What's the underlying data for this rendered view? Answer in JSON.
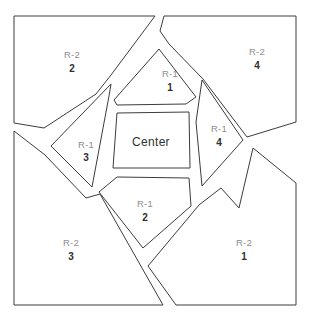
{
  "map": {
    "title": "Zoning Parcel Map",
    "canvas": {
      "width": 314,
      "height": 321
    },
    "style": {
      "background_color": "#ffffff",
      "parcel_fill": "#ffffff",
      "parcel_stroke": "#3c3c3c",
      "zone_label_color": "#8e8e8e",
      "number_label_color": "#2f2f2f",
      "center_label_color": "#2f2f2f"
    },
    "parcels": [
      {
        "id": "r2-2",
        "zone": "R-2",
        "number": "2",
        "label_x": 72,
        "label_y": 55,
        "number_x": 72,
        "number_y": 69,
        "points": "14,16 155,16 111,75 96,94 44,128 14,123"
      },
      {
        "id": "r2-4",
        "zone": "R-2",
        "number": "4",
        "label_x": 257,
        "label_y": 52,
        "number_x": 257,
        "number_y": 66,
        "points": "164,16 296,16 296,122 247,137 203,79 169,44 160,31"
      },
      {
        "id": "r2-3",
        "zone": "R-2",
        "number": "3",
        "label_x": 71,
        "label_y": 243,
        "number_x": 71,
        "number_y": 257,
        "points": "14,131 45,155 86,198 100,194 163,305 14,305"
      },
      {
        "id": "r2-1",
        "zone": "R-2",
        "number": "1",
        "label_x": 244,
        "label_y": 243,
        "number_x": 244,
        "number_y": 257,
        "points": "253,148 296,183 296,305 176,305 148,266 199,205 221,188 239,208"
      },
      {
        "id": "r1-1",
        "zone": "R-1",
        "number": "1",
        "label_x": 170,
        "label_y": 74,
        "number_x": 170,
        "number_y": 88,
        "points": "159,49 196,97 186,104 117,105 114,100"
      },
      {
        "id": "r1-3",
        "zone": "R-1",
        "number": "3",
        "label_x": 86,
        "label_y": 145,
        "number_x": 86,
        "number_y": 158,
        "points": "111,84 109,96 92,187 51,146"
      },
      {
        "id": "r1-4",
        "zone": "R-1",
        "number": "4",
        "label_x": 219,
        "label_y": 129,
        "number_x": 219,
        "number_y": 143,
        "points": "202,80 243,140 202,186 196,122"
      },
      {
        "id": "r1-2",
        "zone": "R-1",
        "number": "2",
        "label_x": 145,
        "label_y": 204,
        "number_x": 145,
        "number_y": 218,
        "points": "117,177 189,178 191,206 143,248 99,192"
      },
      {
        "id": "center",
        "zone": "Center",
        "number": "",
        "label_x": 151,
        "label_y": 143,
        "number_x": 0,
        "number_y": 0,
        "points": "117,113 189,112 190,168 113,168"
      }
    ]
  }
}
